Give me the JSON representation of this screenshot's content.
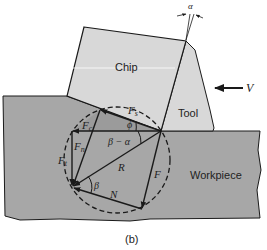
{
  "figure": {
    "caption": "(b)",
    "colors": {
      "workpiece": "#a7a7a7",
      "chip": "#d8d8d8",
      "tool": "#d8d8d8",
      "shear_zone": "#9b9b9b",
      "line": "#1a1a1a"
    },
    "regions": {
      "chip": "Chip",
      "tool": "Tool",
      "workpiece": "Workpiece"
    },
    "velocity": {
      "label": "V"
    },
    "rake_angle": {
      "label": "α"
    },
    "forces": {
      "shear": {
        "label": "F",
        "sub": "s"
      },
      "cutting": {
        "label": "F",
        "sub": "c"
      },
      "normal_shear": {
        "label": "F",
        "sub": "n"
      },
      "thrust": {
        "label": "F",
        "sub": "t"
      },
      "resultant": {
        "label": "R"
      },
      "friction": {
        "label": "F"
      },
      "normal": {
        "label": "N"
      }
    },
    "angles": {
      "shear_angle": "ϕ",
      "beta_minus_alpha": "β − α",
      "friction_angle": "β"
    }
  }
}
